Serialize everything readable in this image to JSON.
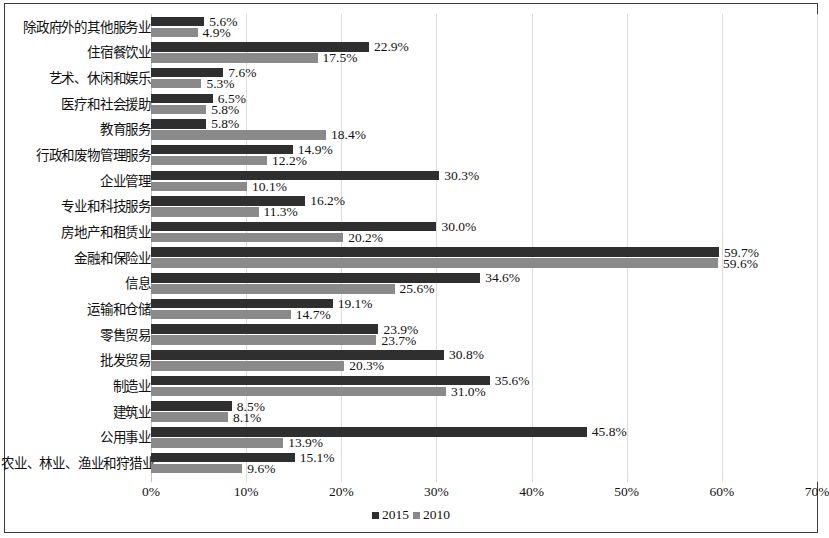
{
  "chart_data": {
    "type": "bar",
    "orientation": "horizontal",
    "title": "",
    "subtitle": "",
    "xlabel": "",
    "ylabel": "",
    "xlim": [
      0,
      70
    ],
    "xtick_labels": [
      "0%",
      "10%",
      "20%",
      "30%",
      "40%",
      "50%",
      "60%",
      "70%"
    ],
    "xticks": [
      0,
      10,
      20,
      30,
      40,
      50,
      60,
      70
    ],
    "grid": true,
    "grid_axis": "x",
    "legend_position": "bottom",
    "value_suffix": "%",
    "categories": [
      "除政府外的其他服务业",
      "住宿餐饮业",
      "艺术、休闲和娱乐",
      "医疗和社会援助",
      "教育服务",
      "行政和废物管理服务",
      "企业管理",
      "专业和科技服务",
      "房地产和租赁业",
      "金融和保险业",
      "信息",
      "运输和仓储",
      "零售贸易",
      "批发贸易",
      "制造业",
      "建筑业",
      "公用事业",
      "农业、林业、渔业和狩猎业"
    ],
    "series": [
      {
        "name": "2015",
        "color": "#2f2f2f",
        "values": [
          5.6,
          22.9,
          7.6,
          6.5,
          5.8,
          14.9,
          30.3,
          16.2,
          30.0,
          59.7,
          34.6,
          19.1,
          23.9,
          30.8,
          35.6,
          8.5,
          45.8,
          15.1
        ],
        "labels": [
          "5.6%",
          "22.9%",
          "7.6%",
          "6.5%",
          "5.8%",
          "14.9%",
          "30.3%",
          "16.2%",
          "30.0%",
          "59.7%",
          "34.6%",
          "19.1%",
          "23.9%",
          "30.8%",
          "35.6%",
          "8.5%",
          "45.8%",
          "15.1%"
        ]
      },
      {
        "name": "2010",
        "color": "#8a8a8a",
        "values": [
          4.9,
          17.5,
          5.3,
          5.8,
          18.4,
          12.2,
          10.1,
          11.3,
          20.2,
          59.6,
          25.6,
          14.7,
          23.7,
          20.3,
          31.0,
          8.1,
          13.9,
          9.6
        ],
        "labels": [
          "4.9%",
          "17.5%",
          "5.3%",
          "5.8%",
          "18.4%",
          "12.2%",
          "10.1%",
          "11.3%",
          "20.2%",
          "59.6%",
          "25.6%",
          "14.7%",
          "23.7%",
          "20.3%",
          "31.0%",
          "8.1%",
          "13.9%",
          "9.6%"
        ]
      }
    ]
  },
  "legend": {
    "items": [
      {
        "label": "2015",
        "color": "#2f2f2f"
      },
      {
        "label": "2010",
        "color": "#8a8a8a"
      }
    ]
  }
}
